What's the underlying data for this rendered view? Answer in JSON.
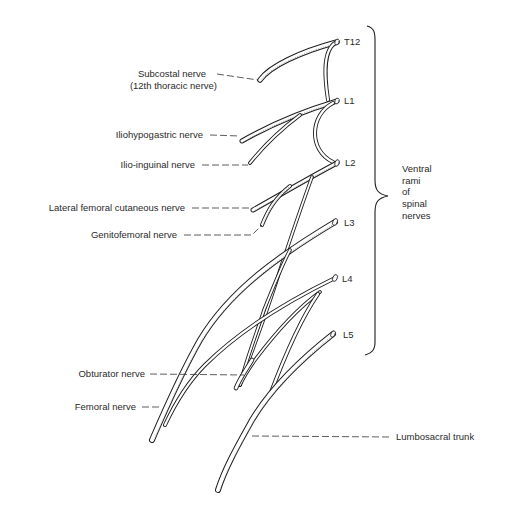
{
  "diagram": {
    "root_labels": [
      {
        "id": "T12",
        "text": "T12"
      },
      {
        "id": "L1",
        "text": "L1"
      },
      {
        "id": "L2",
        "text": "L2"
      },
      {
        "id": "L3",
        "text": "L3"
      },
      {
        "id": "L4",
        "text": "L4"
      },
      {
        "id": "L5",
        "text": "L5"
      }
    ],
    "brace_label": [
      "Ventral",
      "rami",
      "of",
      "spinal",
      "nerves"
    ],
    "nerve_labels": {
      "subcostal_line1": "Subcostal nerve",
      "subcostal_line2": "(12th thoracic nerve)",
      "iliohypogastric": "Iliohypogastric nerve",
      "ilioinguinal": "Ilio-inguinal nerve",
      "lateral_femoral_cutaneous": "Lateral femoral cutaneous nerve",
      "genitofemoral": "Genitofemoral nerve",
      "obturator": "Obturator nerve",
      "femoral": "Femoral nerve",
      "lumbosacral_trunk": "Lumbosacral trunk"
    }
  }
}
